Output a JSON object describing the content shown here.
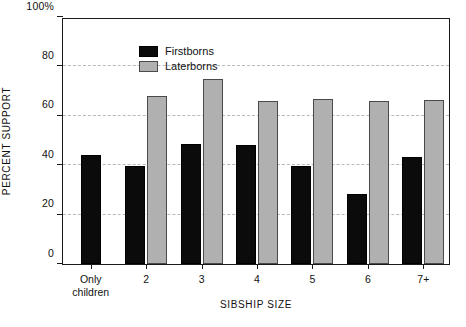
{
  "chart_data": {
    "type": "bar",
    "title": "",
    "xlabel": "SIBSHIP SIZE",
    "ylabel": "PERCENT SUPPORT",
    "categories": [
      "Only\nchildren",
      "2",
      "3",
      "4",
      "5",
      "6",
      "7+"
    ],
    "series": [
      {
        "name": "Firstborns",
        "color": "#0b0b0b",
        "values": [
          44,
          39.5,
          48.5,
          48,
          39.5,
          28.5,
          43.5
        ]
      },
      {
        "name": "Laterborns",
        "color": "#b0b0b0",
        "values": [
          null,
          68,
          75,
          66,
          67,
          66,
          66.5
        ]
      }
    ],
    "ylim": [
      0,
      100
    ],
    "yticks": [
      0,
      20,
      40,
      60,
      80,
      100
    ],
    "ytick_labels": [
      "0",
      "20",
      "40",
      "60",
      "80",
      "100%"
    ],
    "grid": "horizontal-dashed",
    "legend_position": "top-left"
  },
  "legend": {
    "items": [
      {
        "label": "Firstborns"
      },
      {
        "label": "Laterborns"
      }
    ]
  }
}
